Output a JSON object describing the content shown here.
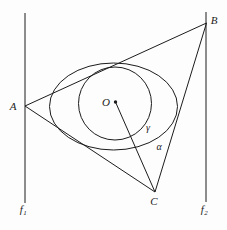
{
  "figure": {
    "canvas": {
      "width": 227,
      "height": 230,
      "background": "#fdfdfd",
      "stroke": "#1c1c1c",
      "stroke_width": 1
    },
    "vertical_lines": {
      "f1": {
        "x": 25,
        "y1": 13,
        "y2": 203
      },
      "f2": {
        "x": 206,
        "y1": 12,
        "y2": 202
      }
    },
    "triangle": {
      "A": [
        25,
        106
      ],
      "B": [
        206.5,
        23
      ],
      "C": [
        155,
        192
      ]
    },
    "ellipse": {
      "cx": 113.5,
      "cy": 106.5,
      "rx": 64,
      "ry": 43.5
    },
    "circle": {
      "cx": 115,
      "cy": 103.5,
      "r": 36.5
    },
    "center_dot": {
      "cx": 115.5,
      "cy": 102,
      "r": 1.7
    },
    "radius_line": {
      "from": [
        115.5,
        102
      ],
      "to": [
        155,
        192
      ]
    }
  },
  "labels": {
    "A": {
      "text": "A",
      "pos": [
        13,
        106
      ]
    },
    "B": {
      "text": "B",
      "pos": [
        214,
        20
      ]
    },
    "C": {
      "text": "C",
      "pos": [
        154,
        201
      ]
    },
    "O": {
      "text": "O",
      "pos": [
        106,
        102
      ]
    },
    "gamma": {
      "text": "γ",
      "pos": [
        148,
        128
      ]
    },
    "alpha": {
      "text": "α",
      "pos": [
        159,
        147
      ]
    },
    "f1": {
      "base": "f",
      "sub": "1",
      "pos": [
        23,
        209
      ]
    },
    "f2": {
      "base": "f",
      "sub": "2",
      "pos": [
        204,
        209
      ]
    }
  }
}
